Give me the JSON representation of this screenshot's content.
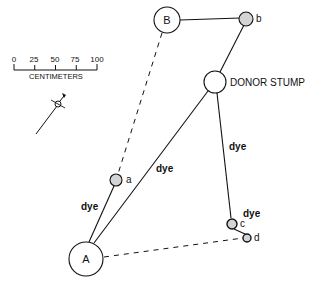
{
  "scale": {
    "ticks": [
      "0",
      "25",
      "50",
      "75",
      "100"
    ],
    "unit_label": "CENTIMETERS"
  },
  "nodes": {
    "A": {
      "label": "A"
    },
    "B": {
      "label": "B"
    },
    "donor": {
      "label": "DONOR STUMP"
    },
    "a": {
      "label": "a"
    },
    "b": {
      "label": "b"
    },
    "c": {
      "label": "c"
    },
    "d": {
      "label": "d"
    }
  },
  "edge_labels": {
    "donor_to_A": "dye",
    "A_to_a": "dye",
    "donor_to_c": "dye",
    "c_to_d": "dye"
  },
  "colors": {
    "line": "#111111",
    "small_node_fill": "#d4d4d4",
    "large_node_fill": "#ffffff"
  }
}
